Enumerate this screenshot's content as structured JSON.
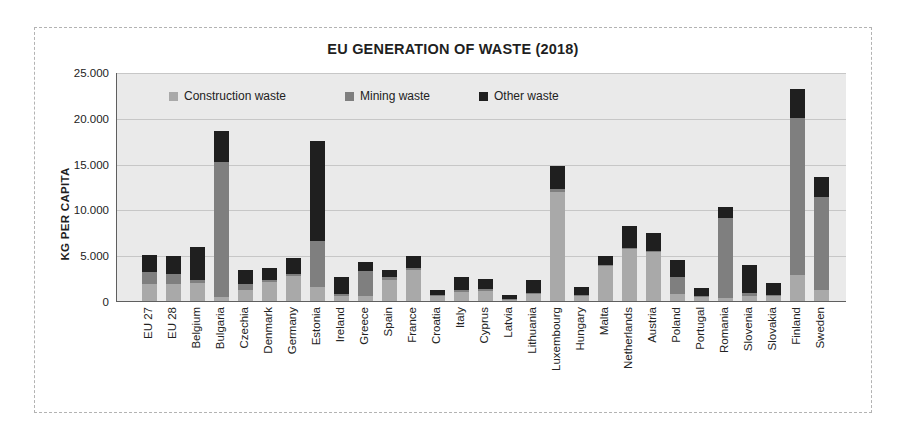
{
  "chart_data": {
    "type": "bar",
    "stacked": true,
    "title": "EU GENERATION OF WASTE (2018)",
    "ylabel": "KG PER CAPITA",
    "xlabel": "",
    "ylim": [
      0,
      25000
    ],
    "ytick_step": 5000,
    "ytick_labels": [
      "0",
      "5.000",
      "10.000",
      "15.000",
      "20.000",
      "25.000"
    ],
    "grid": "horizontal",
    "legend_position": "top-inside",
    "plot_background": "#eaeaea",
    "categories": [
      "EU 27",
      "EU 28",
      "Belgium",
      "Bulgaria",
      "Czechia",
      "Denmark",
      "Germany",
      "Estonia",
      "Ireland",
      "Greece",
      "Spain",
      "France",
      "Croatia",
      "Italy",
      "Cyprus",
      "Latvia",
      "Lithuania",
      "Luxembourg",
      "Hungary",
      "Malta",
      "Netherlands",
      "Austria",
      "Poland",
      "Portugal",
      "Romania",
      "Slovenia",
      "Slovakia",
      "Finland",
      "Sweden"
    ],
    "series": [
      {
        "name": "Construction waste",
        "color": "#a9a9a9",
        "values": [
          1900,
          1900,
          2000,
          400,
          1200,
          2100,
          2700,
          1500,
          500,
          600,
          2300,
          3400,
          600,
          1000,
          1100,
          100,
          800,
          11900,
          600,
          3800,
          5700,
          5300,
          800,
          400,
          300,
          600,
          500,
          2800,
          1200
        ]
      },
      {
        "name": "Mining waste",
        "color": "#7f7f7f",
        "values": [
          1300,
          1100,
          300,
          14800,
          700,
          200,
          300,
          5100,
          300,
          2700,
          300,
          200,
          100,
          200,
          200,
          100,
          100,
          300,
          100,
          100,
          100,
          200,
          1800,
          100,
          8800,
          300,
          200,
          17200,
          10200
        ]
      },
      {
        "name": "Other waste",
        "color": "#1f1f1f",
        "values": [
          1800,
          1900,
          3600,
          3400,
          1500,
          1300,
          1700,
          10900,
          1800,
          1000,
          800,
          1300,
          500,
          1400,
          1100,
          500,
          1400,
          2500,
          800,
          1000,
          2400,
          1900,
          1900,
          900,
          1200,
          3000,
          1300,
          3100,
          2100
        ]
      }
    ]
  }
}
